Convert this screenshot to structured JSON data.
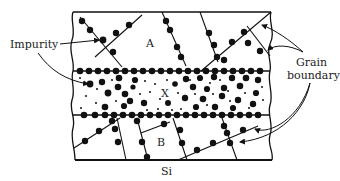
{
  "figure": {
    "labels": {
      "impurity": "Impurity",
      "region_a": "A",
      "region_x": "X",
      "region_b": "B",
      "substrate": "Si",
      "grain_boundary_line1": "Grain",
      "grain_boundary_line2": "boundary"
    },
    "colors": {
      "ink": "#111111",
      "background": "#ffffff"
    }
  }
}
